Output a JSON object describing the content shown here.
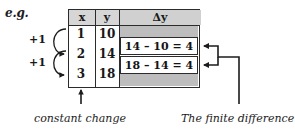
{
  "figure": {
    "example_label": "e.g.",
    "table": {
      "headers": [
        "x",
        "y",
        "Δy"
      ],
      "rows": [
        {
          "x": "1",
          "y": "10"
        },
        {
          "x": "2",
          "y": "14"
        },
        {
          "x": "3",
          "y": "18"
        }
      ],
      "differences": [
        "14 – 10 = 4",
        "18 – 14 = 4"
      ]
    },
    "annotations": {
      "step_labels": [
        "+1",
        "+1"
      ],
      "caption_left": "constant change",
      "caption_right": "The finite difference"
    },
    "colors": {
      "ink": "#1c1c1c",
      "header_fill": "#d4d4d4",
      "band_fill": "#bdbdbd",
      "cell_fill": "#ffffff",
      "page": "#ffffff"
    }
  }
}
